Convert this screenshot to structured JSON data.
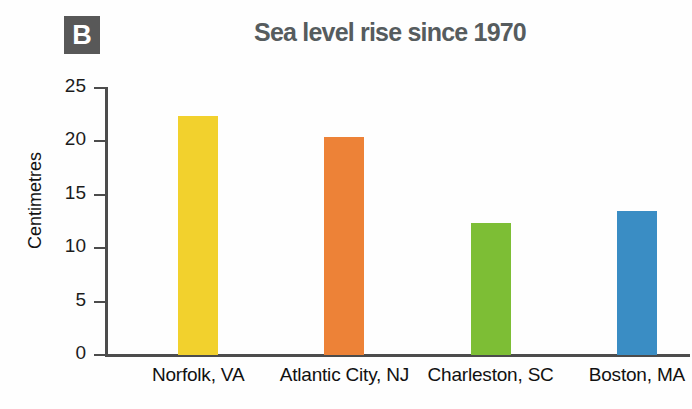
{
  "panel": {
    "label": "B",
    "badge_color": "#585858"
  },
  "chart_data": {
    "type": "bar",
    "title": "Sea level rise since 1970",
    "xlabel": "",
    "ylabel": "Centimetres",
    "ylim": [
      0,
      25
    ],
    "yticks": [
      0,
      5,
      10,
      15,
      20,
      25
    ],
    "ytick_labels": [
      "0",
      "5",
      "10",
      "15",
      "20",
      "25"
    ],
    "grid": false,
    "legend": "none",
    "categories": [
      "Norfolk, VA",
      "Atlantic City, NJ",
      "Charleston, SC",
      "Boston, MA"
    ],
    "values": [
      22.4,
      20.4,
      12.4,
      13.5
    ],
    "colors": [
      "#F2D12D",
      "#ED8237",
      "#7DBE35",
      "#3A8DC4"
    ],
    "series": [
      {
        "name": "Sea level rise since 1970",
        "values": [
          22.4,
          20.4,
          12.4,
          13.5
        ]
      }
    ]
  }
}
